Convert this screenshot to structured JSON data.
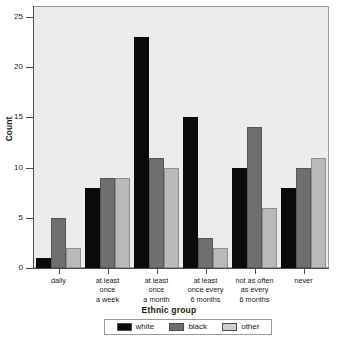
{
  "chart_data": {
    "type": "bar",
    "title": "",
    "xlabel": "Ethnic group",
    "ylabel": "Count",
    "ylim": [
      0,
      26
    ],
    "yticks": [
      0,
      5,
      10,
      15,
      20,
      25
    ],
    "ytick_labels": [
      "0",
      "5",
      "10",
      "15",
      "20",
      "25"
    ],
    "grid": false,
    "legend_position": "bottom",
    "categories": [
      "daily",
      "at least once a week",
      "at least once a month",
      "at least once every 6 months",
      "not as often as every 6 months",
      "never"
    ],
    "category_label_lines": [
      [
        "daily"
      ],
      [
        "at least",
        "once",
        "a week"
      ],
      [
        "at least",
        "once",
        "a month"
      ],
      [
        "at least",
        "once every",
        "6 months"
      ],
      [
        "not as often",
        "as every",
        "6 months"
      ],
      [
        "never"
      ]
    ],
    "series": [
      {
        "name": "white",
        "color": "#0a0a0a",
        "values": [
          1,
          8,
          23,
          15,
          10,
          8
        ]
      },
      {
        "name": "black",
        "color": "#6f6f6f",
        "values": [
          5,
          9,
          11,
          3,
          14,
          10
        ]
      },
      {
        "name": "other",
        "color": "#b9b9b9",
        "values": [
          2,
          9,
          10,
          2,
          6,
          11
        ]
      }
    ]
  },
  "legend": {
    "title": "Ethnic group",
    "entries": [
      {
        "label": "white",
        "swatch": "white-s"
      },
      {
        "label": "black",
        "swatch": "black-s"
      },
      {
        "label": "other",
        "swatch": "other-s"
      }
    ]
  },
  "axes": {
    "y_title": "Count",
    "x_title": "Ethnic group"
  }
}
